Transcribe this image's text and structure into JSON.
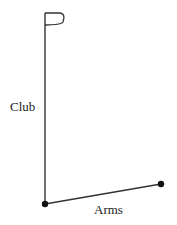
{
  "diagram": {
    "labels": {
      "club": "Club",
      "arms": "Arms"
    },
    "colors": {
      "line": "#333333",
      "joint": "#111111",
      "text": "#222222"
    },
    "points": {
      "club_top": [
        45,
        13
      ],
      "wrist": [
        45,
        204
      ],
      "shoulder": [
        161,
        184
      ]
    },
    "icons": [
      "flag-icon"
    ]
  }
}
